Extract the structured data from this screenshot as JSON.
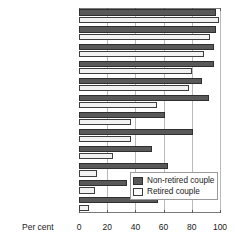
{
  "chart_data": {
    "type": "bar",
    "orientation": "horizontal",
    "title": "",
    "xlabel": "Per cent",
    "ylabel": "",
    "xlim": [
      0,
      100
    ],
    "xticks": [
      0,
      20,
      40,
      60,
      80,
      100
    ],
    "xtick_labels": [
      "0",
      "20",
      "40",
      "60",
      "80",
      "100"
    ],
    "grid": true,
    "legend_position": "inside-lower-right",
    "categories": [
      "Telephone",
      "Washing machine",
      "Central heating",
      "Video recorder",
      "Microwave",
      "CD player",
      "Tumble dryer",
      "Mobile phone",
      "Satellite receiver",
      "Home computer",
      "Dishwasher",
      "Internet connection"
    ],
    "series": [
      {
        "name": "Non-retired couple",
        "color": "#595959",
        "values": [
          97,
          97,
          96,
          96,
          87,
          92,
          61,
          81,
          52,
          63,
          34,
          56
        ]
      },
      {
        "name": "Retired couple",
        "color": "#f2f2f2",
        "values": [
          99,
          93,
          89,
          80,
          78,
          55,
          37,
          37,
          24,
          13,
          11,
          7
        ]
      }
    ]
  },
  "legend": {
    "items": [
      {
        "label": "Non-retired couple"
      },
      {
        "label": "Retired couple"
      }
    ]
  },
  "axis": {
    "x_title": "Per cent"
  }
}
